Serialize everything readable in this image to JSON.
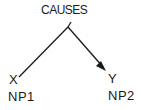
{
  "diagram": {
    "type": "tree",
    "root": {
      "label": "CAUSES"
    },
    "children": [
      {
        "variable": "X",
        "category": "NP1",
        "edge": "line"
      },
      {
        "variable": "Y",
        "category": "NP2",
        "edge": "arrow"
      }
    ],
    "colors": {
      "line": "#1a1a1a",
      "text": "#1a1a1a",
      "background": "#ffffff"
    }
  }
}
